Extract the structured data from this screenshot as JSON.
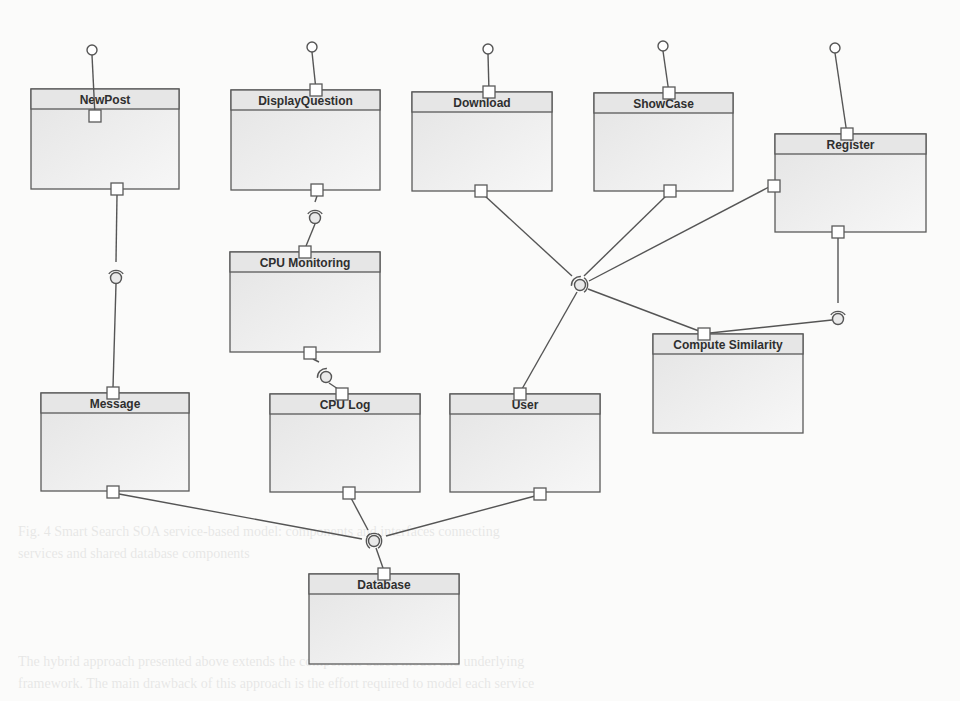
{
  "diagram": {
    "type": "UML component diagram",
    "colors": {
      "line": "#555555",
      "box_border": "#5a5a5a",
      "box_fill": "#ededed",
      "header_fill": "#e6e6e6",
      "port_fill": "#ffffff",
      "background": "#fbfbfa"
    },
    "components": [
      {
        "id": "newpost",
        "label": "NewPost",
        "x": 31,
        "y": 89,
        "w": 148,
        "h": 100
      },
      {
        "id": "displayq",
        "label": "DisplayQuestion",
        "x": 231,
        "y": 90,
        "w": 149,
        "h": 100
      },
      {
        "id": "download",
        "label": "Download",
        "x": 412,
        "y": 92,
        "w": 140,
        "h": 99
      },
      {
        "id": "showcase",
        "label": "ShowCase",
        "x": 594,
        "y": 93,
        "w": 139,
        "h": 98
      },
      {
        "id": "register",
        "label": "Register",
        "x": 775,
        "y": 134,
        "w": 151,
        "h": 98
      },
      {
        "id": "cpumon",
        "label": "CPU Monitoring",
        "x": 230,
        "y": 252,
        "w": 150,
        "h": 100
      },
      {
        "id": "compsim",
        "label": "Compute Similarity",
        "x": 653,
        "y": 334,
        "w": 150,
        "h": 99
      },
      {
        "id": "message",
        "label": "Message",
        "x": 41,
        "y": 393,
        "w": 148,
        "h": 98
      },
      {
        "id": "cpulog",
        "label": "CPU Log",
        "x": 270,
        "y": 394,
        "w": 150,
        "h": 98
      },
      {
        "id": "user",
        "label": "User",
        "x": 450,
        "y": 394,
        "w": 150,
        "h": 98
      },
      {
        "id": "database",
        "label": "Database",
        "x": 309,
        "y": 574,
        "w": 150,
        "h": 90
      }
    ],
    "ports": [
      {
        "x": 95,
        "y": 116
      },
      {
        "x": 117,
        "y": 189
      },
      {
        "x": 316,
        "y": 90
      },
      {
        "x": 317,
        "y": 190
      },
      {
        "x": 489,
        "y": 92
      },
      {
        "x": 481,
        "y": 191
      },
      {
        "x": 669,
        "y": 93
      },
      {
        "x": 670,
        "y": 191
      },
      {
        "x": 847,
        "y": 134
      },
      {
        "x": 774,
        "y": 186
      },
      {
        "x": 838,
        "y": 232
      },
      {
        "x": 305,
        "y": 252
      },
      {
        "x": 310,
        "y": 353
      },
      {
        "x": 704,
        "y": 334
      },
      {
        "x": 113,
        "y": 393
      },
      {
        "x": 113,
        "y": 492
      },
      {
        "x": 342,
        "y": 394
      },
      {
        "x": 349,
        "y": 493
      },
      {
        "x": 520,
        "y": 394
      },
      {
        "x": 540,
        "y": 494
      },
      {
        "x": 384,
        "y": 574
      }
    ],
    "provided_interfaces": [
      {
        "name": "NewPost interface",
        "cx": 92,
        "cy": 50,
        "x2": 95,
        "y2": 116
      },
      {
        "name": "DisplayQuestion interface",
        "cx": 312,
        "cy": 47,
        "x2": 316,
        "y2": 90
      },
      {
        "name": "Download interface",
        "cx": 488,
        "cy": 49,
        "x2": 489,
        "y2": 92
      },
      {
        "name": "ShowCase interface",
        "cx": 663,
        "cy": 46,
        "x2": 669,
        "y2": 93
      },
      {
        "name": "Register interface",
        "cx": 835,
        "cy": 48,
        "x2": 847,
        "y2": 134
      }
    ],
    "connectors": [
      {
        "from": "NewPost",
        "to": "Message",
        "ball": [
          116,
          278
        ],
        "sockets": [
          [
            116,
            268,
            "up"
          ]
        ],
        "lines": [
          [
            117,
            195,
            116,
            262
          ],
          [
            116,
            284,
            113,
            387
          ]
        ]
      },
      {
        "from": "DisplayQuestion",
        "to": "CPU Monitoring",
        "ball": [
          315,
          218
        ],
        "sockets": [
          [
            315,
            208,
            "up"
          ]
        ],
        "lines": [
          [
            317,
            196,
            315,
            202
          ],
          [
            315,
            224,
            306,
            246
          ]
        ]
      },
      {
        "from": "CPU Monitoring",
        "to": "CPU Log",
        "ball": [
          326,
          377
        ],
        "sockets": [
          [
            323,
            367,
            "up-left"
          ]
        ],
        "lines": [
          [
            313,
            359,
            319,
            362
          ],
          [
            329,
            383,
            338,
            389
          ]
        ]
      },
      {
        "from": "Register",
        "to": "Compute Similarity",
        "ball": [
          838,
          319
        ],
        "sockets": [
          [
            838,
            309,
            "up"
          ]
        ],
        "lines": [
          [
            838,
            238,
            838,
            303
          ],
          [
            832,
            320,
            710,
            333
          ]
        ]
      },
      {
        "from": "Download/ShowCase/Register/ComputeSimilarity",
        "to": "User",
        "ball": [
          580,
          285
        ],
        "sockets": [
          [
            575,
            280,
            "up-left"
          ],
          [
            585,
            281,
            "right"
          ]
        ],
        "lines": [
          [
            485,
            196,
            572,
            276
          ],
          [
            666,
            196,
            584,
            276
          ],
          [
            769,
            187,
            589,
            281
          ],
          [
            588,
            289,
            699,
            331
          ],
          [
            577,
            292,
            522,
            389
          ]
        ]
      },
      {
        "from": "Message/CPU Log/User",
        "to": "Database",
        "ball": [
          374,
          541
        ],
        "sockets": [
          [
            370,
            538,
            "left"
          ],
          [
            378,
            538,
            "right"
          ],
          [
            374,
            533,
            "up"
          ]
        ],
        "lines": [
          [
            119,
            494,
            362,
            539
          ],
          [
            351,
            498,
            368,
            530
          ],
          [
            535,
            496,
            386,
            536
          ],
          [
            376,
            548,
            383,
            568
          ]
        ]
      }
    ]
  },
  "background_text": {
    "caption_line_1": "Fig. 4  Smart Search SOA service-based model: components and interfaces connecting",
    "caption_line_2": "services and shared database components",
    "body_line_1": "The hybrid approach presented above extends the component-based model and underlying",
    "body_line_2": "framework. The main drawback of this approach is the effort required to model each service"
  }
}
